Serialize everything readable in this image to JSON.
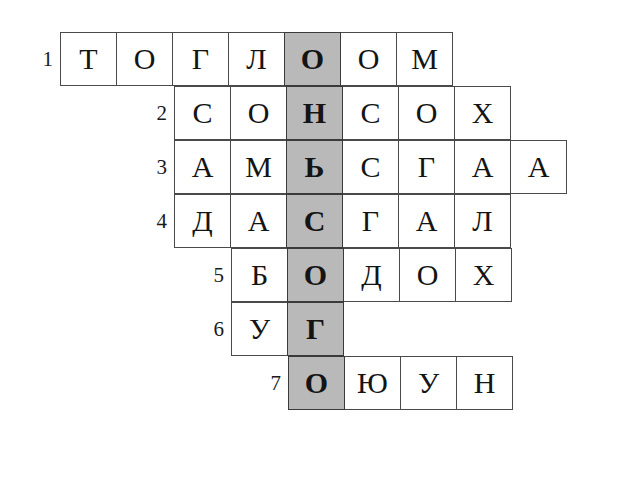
{
  "puzzle": {
    "type": "crossword-word-ladder",
    "rows_total": 7,
    "columns_total": 9,
    "cell_width": 57,
    "cell_height": 54,
    "grid_origin_x": 60,
    "grid_origin_y": 32,
    "highlight_column_index": 5,
    "highlight_color": "#b9b9b9",
    "cell_background": "#ffffff",
    "border_color": "#4a4a4a",
    "text_color": "#141414",
    "highlight_word": "ОНЬСОГО",
    "rows": [
      {
        "number": "1",
        "start_column": 1,
        "letters": [
          "Т",
          "О",
          "Г",
          "Л",
          "О",
          "О",
          "М"
        ],
        "word": "ТОГЛООМ"
      },
      {
        "number": "2",
        "start_column": 3,
        "letters": [
          "С",
          "О",
          "Н",
          "С",
          "О",
          "Х"
        ],
        "word": "СОНСОХ"
      },
      {
        "number": "3",
        "start_column": 3,
        "letters": [
          "А",
          "М",
          "Ь",
          "С",
          "Г",
          "А",
          "А"
        ],
        "word": "АМЬСГАА"
      },
      {
        "number": "4",
        "start_column": 3,
        "letters": [
          "Д",
          "А",
          "С",
          "Г",
          "А",
          "Л"
        ],
        "word": "ДАСГАЛ"
      },
      {
        "number": "5",
        "start_column": 4,
        "letters": [
          "Б",
          "О",
          "Д",
          "О",
          "Х"
        ],
        "word": "БОДОХ"
      },
      {
        "number": "6",
        "start_column": 4,
        "letters": [
          "У",
          "Г"
        ],
        "word": "УГ"
      },
      {
        "number": "7",
        "start_column": 5,
        "letters": [
          "О",
          "Ю",
          "У",
          "Н"
        ],
        "word": "ОЮУН"
      }
    ]
  }
}
